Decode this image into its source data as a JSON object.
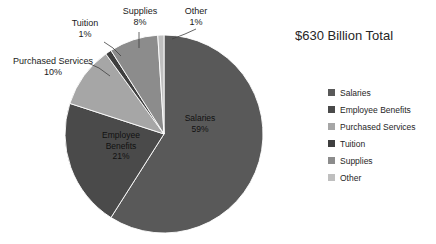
{
  "chart_data": {
    "type": "pie",
    "title": "$630 Billion Total",
    "categories": [
      "Salaries",
      "Employee Benefits",
      "Purchased Services",
      "Tuition",
      "Supplies",
      "Other"
    ],
    "values": [
      59,
      21,
      10,
      1,
      8,
      1
    ],
    "value_unit": "%",
    "total_label": "$630 Billion Total",
    "start_angle_deg": 0,
    "direction": "clockwise",
    "legend_position": "right",
    "grid": false,
    "colors": [
      "#595959",
      "#4a4a4a",
      "#a6a6a6",
      "#3f3f3f",
      "#8c8c8c",
      "#bfbfbf"
    ],
    "slices": [
      {
        "name": "Salaries",
        "value": 59,
        "label": "Salaries",
        "percent_label": "59%",
        "color": "#595959",
        "label_placement": "inside"
      },
      {
        "name": "Employee Benefits",
        "value": 21,
        "label": "Employee Benefits",
        "percent_label": "21%",
        "color": "#4a4a4a",
        "label_placement": "inside"
      },
      {
        "name": "Purchased Services",
        "value": 10,
        "label": "Purchased Services",
        "percent_label": "10%",
        "color": "#a6a6a6",
        "label_placement": "callout"
      },
      {
        "name": "Tuition",
        "value": 1,
        "label": "Tuition",
        "percent_label": "1%",
        "color": "#3f3f3f",
        "label_placement": "callout"
      },
      {
        "name": "Supplies",
        "value": 8,
        "label": "Supplies",
        "percent_label": "8%",
        "color": "#8c8c8c",
        "label_placement": "callout"
      },
      {
        "name": "Other",
        "value": 1,
        "label": "Other",
        "percent_label": "1%",
        "color": "#bfbfbf",
        "label_placement": "callout"
      }
    ]
  },
  "title": "$630 Billion Total",
  "slice_labels": {
    "salaries_name": "Salaries",
    "salaries_pct": "59%",
    "employee_benefits_line1": "Employee",
    "employee_benefits_line2": "Benefits",
    "employee_benefits_pct": "21%"
  },
  "callouts": {
    "purchased_services_name": "Purchased Services",
    "purchased_services_pct": "10%",
    "tuition_name": "Tuition",
    "tuition_pct": "1%",
    "supplies_name": "Supplies",
    "supplies_pct": "8%",
    "other_name": "Other",
    "other_pct": "1%"
  },
  "legend": {
    "items": [
      {
        "label": "Salaries",
        "color": "#595959"
      },
      {
        "label": "Employee Benefits",
        "color": "#4a4a4a"
      },
      {
        "label": "Purchased Services",
        "color": "#a6a6a6"
      },
      {
        "label": "Tuition",
        "color": "#3f3f3f"
      },
      {
        "label": "Supplies",
        "color": "#8c8c8c"
      },
      {
        "label": "Other",
        "color": "#bfbfbf"
      }
    ]
  }
}
